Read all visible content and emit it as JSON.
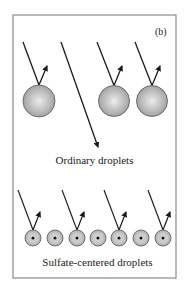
{
  "panel": {
    "label": "(b)",
    "frame": {
      "x": 13,
      "y": 15,
      "width": 163,
      "height": 263
    },
    "colors": {
      "frame": "#8a8a8a",
      "line": "#1a1a1a",
      "sphere_center": "#ececec",
      "sphere_edge": "#9c9c9c",
      "sphere_outline": "#555555",
      "dot": "#111111"
    }
  },
  "ordinary_droplets": {
    "caption": "Ordinary droplets",
    "droplets": [
      {
        "cx": 39,
        "cy": 101,
        "r": 16,
        "incoming": {
          "x1": 23,
          "y1": 42
        },
        "reflected": {
          "x2": 47,
          "y2": 66
        }
      },
      {
        "cx": 114,
        "cy": 101,
        "r": 15.5,
        "incoming": {
          "x1": 97,
          "y1": 42
        },
        "reflected": {
          "x2": 122,
          "y2": 66
        }
      },
      {
        "cx": 152,
        "cy": 101,
        "r": 15.5,
        "incoming": {
          "x1": 135,
          "y1": 42
        },
        "reflected": {
          "x2": 160,
          "y2": 66
        }
      }
    ],
    "transmitted_ray": {
      "x1": 61,
      "y1": 42,
      "x2": 98,
      "y2": 147
    }
  },
  "sulfate_droplets": {
    "caption": "Sulfate-centered droplets",
    "cy": 238,
    "r": 8,
    "centers_x": [
      33,
      55,
      77,
      98,
      119,
      141,
      163
    ],
    "rays": [
      {
        "target_index": 0,
        "x1": 18,
        "y1": 190,
        "reflect_x2": 40,
        "reflect_y2": 212
      },
      {
        "target_index": 2,
        "x1": 62,
        "y1": 190,
        "reflect_x2": 84,
        "reflect_y2": 212
      },
      {
        "target_index": 4,
        "x1": 104,
        "y1": 190,
        "reflect_x2": 126,
        "reflect_y2": 212
      },
      {
        "target_index": 6,
        "x1": 148,
        "y1": 190,
        "reflect_x2": 170,
        "reflect_y2": 212
      }
    ]
  }
}
